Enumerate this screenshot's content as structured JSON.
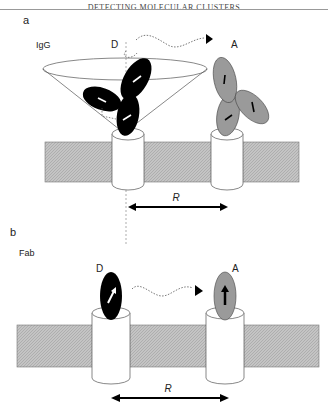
{
  "header": {
    "running_title": "DETECTING MOLECULAR CLUSTERS"
  },
  "figure": {
    "panel_a": {
      "label": "a",
      "molecule": "IgG",
      "donor": "D",
      "acceptor": "A",
      "distance": "R"
    },
    "panel_b": {
      "label": "b",
      "molecule": "Fab",
      "donor": "D",
      "acceptor": "A",
      "distance": "R"
    },
    "colors": {
      "donor": "#000000",
      "acceptor": "#9a9a9a",
      "membrane": "#bdbdbd"
    }
  }
}
